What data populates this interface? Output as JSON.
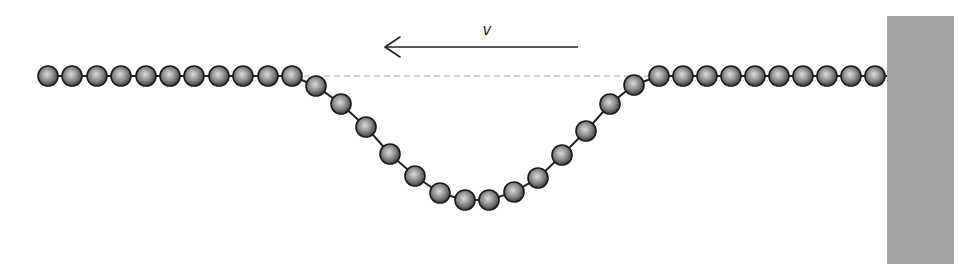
{
  "diagram": {
    "velocity_label": "v",
    "arrow": {
      "x_start": 578,
      "x_end": 385,
      "y": 47,
      "direction": "left"
    },
    "label_pos": {
      "x": 487,
      "y": 35
    },
    "equilibrium_line": {
      "x1": 304,
      "x2": 648,
      "y": 76,
      "style": "dashed",
      "color": "#aaaaaa"
    },
    "wall": {
      "x": 887,
      "y": 16,
      "width": 67,
      "height": 248,
      "color": "#a3a3a3"
    },
    "bead": {
      "radius": 10,
      "fill_light": "#dcdcdc",
      "fill_mid": "#8a8a8a",
      "fill_dark": "#3a3a3a",
      "stroke": "#1a1a1a"
    },
    "string_color": "#222222",
    "beads": [
      [
        48,
        76
      ],
      [
        72,
        76
      ],
      [
        97,
        76
      ],
      [
        121,
        76
      ],
      [
        146,
        76
      ],
      [
        170,
        76
      ],
      [
        194,
        76
      ],
      [
        219,
        76
      ],
      [
        243,
        76
      ],
      [
        268,
        76
      ],
      [
        292,
        76
      ],
      [
        316,
        86
      ],
      [
        341,
        104
      ],
      [
        366,
        127
      ],
      [
        390,
        154
      ],
      [
        415,
        176
      ],
      [
        440,
        193
      ],
      [
        465,
        200
      ],
      [
        489,
        200
      ],
      [
        514,
        192
      ],
      [
        538,
        178
      ],
      [
        562,
        155
      ],
      [
        586,
        131
      ],
      [
        610,
        104
      ],
      [
        634,
        85
      ],
      [
        659,
        76
      ],
      [
        683,
        76
      ],
      [
        707,
        76
      ],
      [
        731,
        76
      ],
      [
        755,
        76
      ],
      [
        779,
        76
      ],
      [
        803,
        76
      ],
      [
        827,
        76
      ],
      [
        851,
        76
      ],
      [
        875,
        76
      ]
    ]
  }
}
